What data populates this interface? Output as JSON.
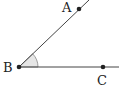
{
  "diagram": {
    "type": "angle",
    "vertex": "B",
    "points": [
      {
        "label": "A",
        "x": 79,
        "y": 9,
        "lx": 62,
        "ly": 12
      },
      {
        "label": "B",
        "x": 19,
        "y": 67,
        "lx": 3,
        "ly": 72
      },
      {
        "label": "C",
        "x": 103,
        "y": 67,
        "lx": 97,
        "ly": 85
      }
    ],
    "rays": [
      {
        "from": "B",
        "to": "A",
        "x2": 89,
        "y2": 0
      },
      {
        "from": "B",
        "to": "C",
        "x2": 119,
        "y2": 67
      }
    ],
    "angle_mark": {
      "at": "B",
      "radius": 19,
      "fill": "#e6e6e6"
    },
    "colors": {
      "line": "#444444",
      "dot": "#222222",
      "label": "#222222"
    }
  }
}
